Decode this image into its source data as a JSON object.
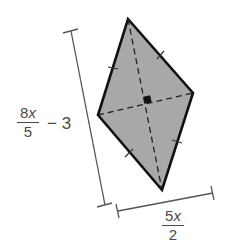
{
  "figure": {
    "shape": "rhombus",
    "fill_color": "#a8a8a8",
    "stroke_color": "#111111",
    "vertices": {
      "top": [
        128,
        19
      ],
      "right": [
        193,
        93
      ],
      "bottom": [
        162,
        190
      ],
      "left": [
        98,
        115
      ]
    },
    "diagonals": {
      "style": "dashed",
      "right_angle_marker": true
    },
    "congruent_side_ticks": 4
  },
  "labels": {
    "vertical_diagonal": {
      "numerator_coef": "8",
      "numerator_var": "x",
      "denominator": "5",
      "suffix": "− 3"
    },
    "horizontal_diagonal": {
      "numerator_coef": "5",
      "numerator_var": "x",
      "denominator": "2"
    }
  }
}
